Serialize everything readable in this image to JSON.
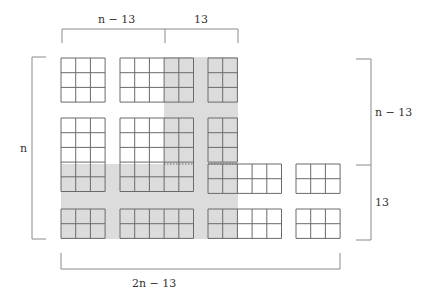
{
  "colors": {
    "shade": "#dcdcdc",
    "grid_line": "#6a6a6a",
    "bracket_line": "#8a8a8a",
    "text": "#333333"
  },
  "labels": {
    "top_left": "n − 13",
    "top_right": "13",
    "left": "n",
    "right_top": "n − 13",
    "right_bottom": "13",
    "bottom": "2n − 13"
  },
  "shaded_regions": [
    {
      "x": 164,
      "y": 57,
      "w": 74,
      "h": 182
    },
    {
      "x": 61,
      "y": 164,
      "w": 177,
      "h": 75
    }
  ],
  "blocks": [
    {
      "id": "r1-g1",
      "x": 61,
      "y": 58,
      "cols": 3,
      "rows": 3
    },
    {
      "id": "r1-g2",
      "x": 120,
      "y": 58,
      "cols": 5,
      "rows": 3
    },
    {
      "id": "r1-g3",
      "x": 208,
      "y": 58,
      "cols": 2,
      "rows": 3
    },
    {
      "id": "r2-g1",
      "x": 61,
      "y": 118,
      "cols": 3,
      "rows": 5
    },
    {
      "id": "r2-g2",
      "x": 120,
      "y": 118,
      "cols": 5,
      "rows": 5
    },
    {
      "id": "r2-g3-top",
      "x": 208,
      "y": 118,
      "cols": 2,
      "rows": 3
    },
    {
      "id": "r2-g3-bottom",
      "x": 208,
      "y": 164,
      "cols": 5,
      "rows": 2
    },
    {
      "id": "r2-g4",
      "x": 296,
      "y": 164,
      "cols": 3,
      "rows": 2
    },
    {
      "id": "r3-g1",
      "x": 61,
      "y": 209,
      "cols": 3,
      "rows": 2
    },
    {
      "id": "r3-g2",
      "x": 120,
      "y": 209,
      "cols": 5,
      "rows": 2
    },
    {
      "id": "r3-g3",
      "x": 208,
      "y": 209,
      "cols": 5,
      "rows": 2
    },
    {
      "id": "r3-g4",
      "x": 296,
      "y": 209,
      "cols": 3,
      "rows": 2
    }
  ],
  "cell_size": 14.7,
  "dotted_lines": [
    {
      "x1": 164,
      "x2": 194,
      "y": 164
    },
    {
      "x1": 208,
      "x2": 238,
      "y": 164
    }
  ]
}
